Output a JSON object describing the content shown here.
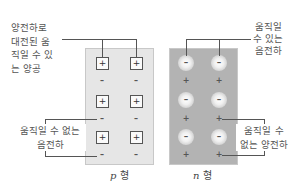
{
  "labels": {
    "top_left": [
      "양전하로",
      "대전된 움",
      "직일 수 있",
      "는 양공"
    ],
    "top_right": [
      "움직일",
      "수 있는",
      "음전하"
    ],
    "bottom_left": [
      "움직일 수 없는",
      "음전하"
    ],
    "bottom_right": [
      "움직일 수",
      "없는 양전하"
    ]
  },
  "captions": {
    "p_letter": "p",
    "p_suffix": " 형",
    "n_letter": "n",
    "n_suffix": " 형"
  },
  "symbols": {
    "plus": "+",
    "minus": "−",
    "dash": "–"
  },
  "colors": {
    "p_panel": "#e6e6e6",
    "n_panel": "#b3b3b3",
    "line": "#555555"
  }
}
